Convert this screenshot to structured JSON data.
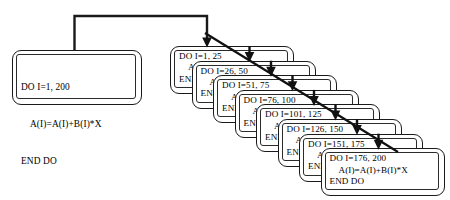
{
  "diagram": {
    "body_statement": "A(I)=A(I)+B(I)*X",
    "end_statement": "END DO",
    "colors": {
      "line": "#1a1a1a",
      "box_border": "#1a1a1a",
      "background": "#ffffff"
    },
    "source_loop": {
      "header": "DO I=1, 200",
      "body": "A(I)=A(I)+B(I)*X",
      "end": "END DO"
    },
    "chunks": [
      {
        "header": "DO I=1, 25",
        "body": "A(I)=A(I)+B(I)*X",
        "end": "END DO",
        "start": 1,
        "stop": 25
      },
      {
        "header": "DO I=26, 50",
        "body": "A(I)=A(I)+B(I)*X",
        "end": "END DO",
        "start": 26,
        "stop": 50
      },
      {
        "header": "DO I=51, 75",
        "body": "A(I)=A(I)+B(I)*X",
        "end": "END DO",
        "start": 51,
        "stop": 75
      },
      {
        "header": "DO I=76, 100",
        "body": "A(I)=A(I)+B(I)*X",
        "end": "END DO",
        "start": 76,
        "stop": 100
      },
      {
        "header": "DO I=101, 125",
        "body": "A(I)=A(I)+B(I)*X",
        "end": "END DO",
        "start": 101,
        "stop": 125
      },
      {
        "header": "DO I=126, 150",
        "body": "A(I)=A(I)+B(I)*X",
        "end": "END DO",
        "start": 126,
        "stop": 150
      },
      {
        "header": "DO I=151, 175",
        "body": "A(I)=A(I)+B(I)*X",
        "end": "END DO",
        "start": 151,
        "stop": 175
      },
      {
        "header": "DO I=176, 200",
        "body": "A(I)=A(I)+B(I)*X",
        "end": "END DO",
        "start": 176,
        "stop": 200
      }
    ]
  }
}
